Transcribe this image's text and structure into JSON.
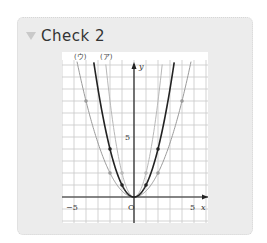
{
  "header": {
    "title": "Check 2",
    "marker_icon": "triangle-down-icon"
  },
  "graph": {
    "labels": {
      "curve_u": "(ウ)",
      "curve_a": "(ア)",
      "y_axis": "y",
      "x_axis": "x",
      "origin": "O",
      "x_min_tick": "−5",
      "x_max_tick": "5",
      "y_tick": "5"
    },
    "colors": {
      "black_curve": "#222222",
      "gray_curve": "#9a9a9a",
      "light_curve": "#b8b8b8",
      "grid": "#c8c8c8",
      "axis": "#222222"
    }
  },
  "chart_data": {
    "type": "line",
    "title": "",
    "xlabel": "x",
    "ylabel": "y",
    "xlim": [
      -6,
      6
    ],
    "ylim": [
      -2,
      11.4
    ],
    "grid": true,
    "series": [
      {
        "name": "(ア) y = 2x²",
        "label": "(ア)",
        "points": [
          [
            -1,
            2
          ],
          [
            1,
            2
          ],
          [
            -2,
            8
          ],
          [
            2,
            8
          ]
        ]
      },
      {
        "name": "y = x²",
        "points": [
          [
            -2,
            4
          ],
          [
            -1,
            1
          ],
          [
            0,
            0
          ],
          [
            1,
            1
          ],
          [
            2,
            4
          ]
        ]
      },
      {
        "name": "(ウ) y = ½x²",
        "label": "(ウ)",
        "points": [
          [
            -4,
            8
          ],
          [
            -2,
            2
          ],
          [
            0,
            0
          ],
          [
            2,
            2
          ],
          [
            4,
            8
          ]
        ]
      }
    ]
  }
}
